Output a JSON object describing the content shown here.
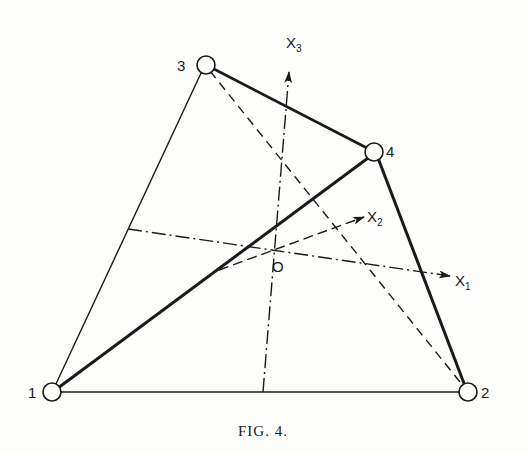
{
  "figure": {
    "caption": "Fig. 4.",
    "caption_display": "FIG. 4.",
    "colors": {
      "ink": "#1a1a1a",
      "background": "#fdfdfb"
    },
    "nodes": [
      {
        "id": "1",
        "label": "1"
      },
      {
        "id": "2",
        "label": "2"
      },
      {
        "id": "3",
        "label": "3"
      },
      {
        "id": "4",
        "label": "4"
      }
    ],
    "origin_label": "O",
    "axes": [
      {
        "name": "X",
        "sub": "1"
      },
      {
        "name": "X",
        "sub": "2"
      },
      {
        "name": "X",
        "sub": "3"
      }
    ],
    "edges": [
      {
        "from": "1",
        "to": "2",
        "style": "solid-thin"
      },
      {
        "from": "1",
        "to": "3",
        "style": "solid-thin"
      },
      {
        "from": "1",
        "to": "4",
        "style": "solid-thick"
      },
      {
        "from": "3",
        "to": "4",
        "style": "solid-thick"
      },
      {
        "from": "4",
        "to": "2",
        "style": "solid-thick"
      },
      {
        "from": "3",
        "to": "2",
        "style": "dashed"
      }
    ]
  }
}
